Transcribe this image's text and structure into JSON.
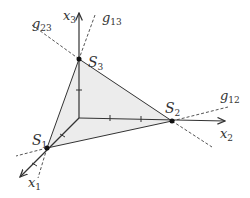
{
  "diagram": {
    "axes": [
      {
        "name": "x1",
        "label": "x",
        "sub": "1"
      },
      {
        "name": "x2",
        "label": "x",
        "sub": "2"
      },
      {
        "name": "x3",
        "label": "x",
        "sub": "3"
      }
    ],
    "vertices": [
      {
        "name": "S1",
        "label": "S",
        "sub": "1"
      },
      {
        "name": "S2",
        "label": "S",
        "sub": "2"
      },
      {
        "name": "S3",
        "label": "S",
        "sub": "3"
      }
    ],
    "lines": [
      {
        "name": "g12",
        "label": "g",
        "sub": "12"
      },
      {
        "name": "g13",
        "label": "g",
        "sub": "13"
      },
      {
        "name": "g23",
        "label": "g",
        "sub": "23"
      }
    ],
    "colors": {
      "fill": "#e8e8e8",
      "stroke": "#333333",
      "dashed": "#555555"
    }
  }
}
